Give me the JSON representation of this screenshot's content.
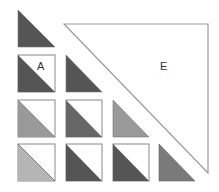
{
  "diagram": {
    "type": "lower-triangular block matrix",
    "labels": {
      "cell_A": "A",
      "region_E": "E"
    },
    "colors": {
      "dark": "#555555",
      "darker_mid": "#666666",
      "mid": "#777777",
      "light": "#999999",
      "lighter": "#b5b5b5",
      "border": "#888888",
      "outline_E": "#999999"
    },
    "cells": [
      {
        "row": 0,
        "col": 0,
        "shade": "dark",
        "boxed": false
      },
      {
        "row": 1,
        "col": 0,
        "shade": "dark",
        "boxed": true,
        "label": "A"
      },
      {
        "row": 1,
        "col": 1,
        "shade": "dark",
        "boxed": false
      },
      {
        "row": 2,
        "col": 0,
        "shade": "light",
        "boxed": true
      },
      {
        "row": 2,
        "col": 1,
        "shade": "darker_mid",
        "boxed": true
      },
      {
        "row": 2,
        "col": 2,
        "shade": "light",
        "boxed": false
      },
      {
        "row": 3,
        "col": 0,
        "shade": "lighter",
        "boxed": true
      },
      {
        "row": 3,
        "col": 1,
        "shade": "dark",
        "boxed": true
      },
      {
        "row": 3,
        "col": 2,
        "shade": "dark",
        "boxed": true
      },
      {
        "row": 3,
        "col": 3,
        "shade": "mid",
        "boxed": false
      }
    ]
  }
}
